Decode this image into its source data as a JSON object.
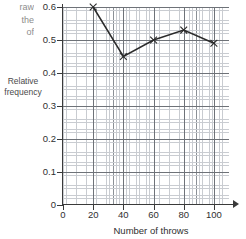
{
  "question_fragment": {
    "line1": "raw",
    "line2": "the",
    "line3": "of"
  },
  "chart_data": {
    "type": "line",
    "title": "",
    "xlabel": "Number of throws",
    "ylabel": "Relative frequency",
    "xlim": [
      0,
      110
    ],
    "ylim": [
      0,
      0.6
    ],
    "xticks": [
      "0",
      "20",
      "40",
      "60",
      "80",
      "100"
    ],
    "xtick_values": [
      0,
      20,
      40,
      60,
      80,
      100
    ],
    "yticks": [
      "0",
      "0.1",
      "0.2",
      "0.3",
      "0.4",
      "0.5",
      "0.6"
    ],
    "ytick_values": [
      0,
      0.1,
      0.2,
      0.3,
      0.4,
      0.5,
      0.6
    ],
    "grid": true,
    "grid_minor": true,
    "legend": false,
    "marker": "x",
    "x": [
      20,
      40,
      60,
      80,
      100
    ],
    "values": [
      0.6,
      0.45,
      0.5,
      0.53,
      0.49
    ],
    "series": [
      {
        "name": "Relative frequency",
        "x": [
          20,
          40,
          60,
          80,
          100
        ],
        "values": [
          0.6,
          0.45,
          0.5,
          0.53,
          0.49
        ]
      }
    ],
    "colors": {
      "line": "#2b2b2b",
      "grid_minor": "#c9ccd1",
      "grid_major": "#8b9096",
      "grid_strong": "#6e7278",
      "axis": "#3a3a3a",
      "text": "#2f2f2f"
    }
  }
}
